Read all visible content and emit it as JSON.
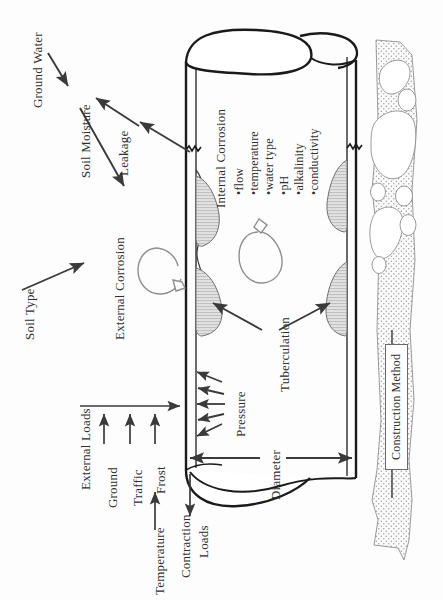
{
  "diagram": {
    "orientation": "rotated-90-ccw",
    "colors": {
      "ink": "#2f2f2f",
      "pipe_outline": "#1a1a1a",
      "arrow": "#3a3a3a",
      "tubercle_fill": "#d8d8d8",
      "soil_fill": "#f2f2f2",
      "background": "#fdfdfd"
    },
    "labels": {
      "ground_water": "Ground Water",
      "soil_moisture": "Soil Moisture",
      "leakage": "Leakage",
      "soil_type": "Soil Type",
      "external_corrosion": "External Corrosion",
      "internal_corrosion": "Internal Corrosion",
      "tuberculation": "Tuberculation",
      "pressure": "Pressure",
      "diameter": "Diameter",
      "construction_method": "Construction Method",
      "external_loads": "External Loads",
      "ground": "Ground",
      "traffic": "Traffic",
      "frost": "Frost",
      "temperature": "Temperature",
      "contraction": "Contraction",
      "loads": "Loads"
    },
    "internal_corrosion_factors": [
      "•flow",
      "•temperature",
      "•water type",
      "•pH",
      "•alkalinity",
      "•conductivity"
    ]
  }
}
